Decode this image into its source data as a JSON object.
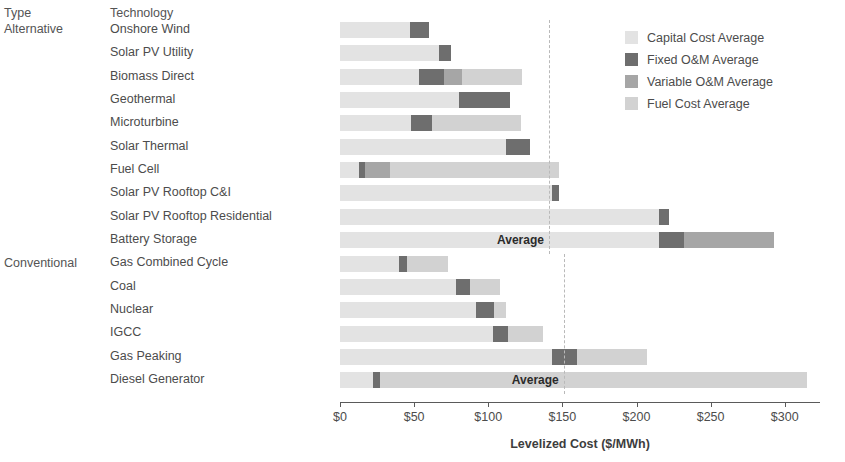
{
  "headers": {
    "type": "Type",
    "technology": "Technology"
  },
  "groups": [
    {
      "name": "Alternative",
      "start_index": 0
    },
    {
      "name": "Conventional",
      "start_index": 10
    }
  ],
  "legend": {
    "items": [
      {
        "label": "Capital Cost Average",
        "color": "#e3e3e3",
        "key": "capital"
      },
      {
        "label": "Fixed O&M Average",
        "color": "#6e6e6e",
        "key": "fixed"
      },
      {
        "label": "Variable O&M Average",
        "color": "#a6a6a6",
        "key": "variable"
      },
      {
        "label": "Fuel Cost Average",
        "color": "#d2d2d2",
        "key": "fuel"
      }
    ]
  },
  "annotations": [
    {
      "label": "Average",
      "value": 141,
      "group": "Alternative",
      "row_index": 9
    },
    {
      "label": "Average",
      "value": 151,
      "group": "Conventional",
      "row_index": 15
    }
  ],
  "chart_data": {
    "type": "bar",
    "orientation": "horizontal",
    "stacked": true,
    "title": "",
    "xlabel": "Levelized Cost ($/MWh)",
    "ylabel": "",
    "xlim": [
      0,
      315
    ],
    "xticks": [
      0,
      50,
      100,
      150,
      200,
      250,
      300
    ],
    "xticklabels": [
      "$0",
      "$50",
      "$100",
      "$150",
      "$200",
      "$250",
      "$300"
    ],
    "grid": false,
    "legend_position": "top-right",
    "categories": [
      "Onshore Wind",
      "Solar PV Utility",
      "Biomass Direct",
      "Geothermal",
      "Microturbine",
      "Solar Thermal",
      "Fuel Cell",
      "Solar PV Rooftop C&I",
      "Solar PV Rooftop Residential",
      "Battery Storage",
      "Gas Combined Cycle",
      "Coal",
      "Nuclear",
      "IGCC",
      "Gas Peaking",
      "Diesel Generator"
    ],
    "series": [
      {
        "name": "Capital Cost Average",
        "values": [
          47,
          67,
          53,
          80,
          48,
          112,
          13,
          143,
          215,
          215,
          40,
          78,
          92,
          103,
          143,
          22
        ]
      },
      {
        "name": "Fixed O&M Average",
        "values": [
          13,
          8,
          17,
          35,
          14,
          16,
          4,
          5,
          7,
          17,
          5,
          10,
          12,
          10,
          17,
          5
        ]
      },
      {
        "name": "Variable O&M Average",
        "values": [
          0,
          0,
          12,
          0,
          0,
          0,
          17,
          0,
          0,
          61,
          0,
          0,
          0,
          0,
          0,
          0
        ]
      },
      {
        "name": "Fuel Cost Average",
        "values": [
          0,
          0,
          41,
          0,
          60,
          0,
          114,
          0,
          0,
          0,
          28,
          20,
          8,
          24,
          47,
          288
        ]
      }
    ],
    "totals": [
      60,
      75,
      123,
      115,
      122,
      128,
      148,
      148,
      222,
      293,
      73,
      108,
      112,
      137,
      207,
      315
    ],
    "reference_lines": [
      {
        "name": "Alternative Average",
        "value": 141,
        "style": "dashed"
      },
      {
        "name": "Conventional Average",
        "value": 151,
        "style": "dashed"
      }
    ]
  }
}
